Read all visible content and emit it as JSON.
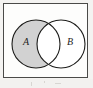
{
  "figure": {
    "kind": "venn-diagram",
    "caption": "",
    "shaded_description": "A minus B",
    "background_color": "#f4f3f1"
  },
  "universe": {
    "label": "",
    "border_color": "#4a4a48",
    "fill_color": "#fdfdfc"
  },
  "sets": [
    {
      "id": "A",
      "label": "A",
      "shaded": true,
      "fill_color": "#d2d2d2",
      "stroke_color": "#1d1d1b",
      "cx": 32,
      "cy": 40,
      "r": 24
    },
    {
      "id": "B",
      "label": "B",
      "shaded": false,
      "fill_color": "#ffffff",
      "stroke_color": "#1d1d1b",
      "cx": 57,
      "cy": 40,
      "r": 24
    }
  ],
  "regions": {
    "a_only": {
      "shaded": true,
      "fill_color": "#d2d2d2"
    },
    "intersection": {
      "shaded": false,
      "fill_color": "#ffffff"
    },
    "b_only": {
      "shaded": false,
      "fill_color": "#ffffff"
    },
    "outside": {
      "shaded": false,
      "fill_color": "#fdfdfc"
    }
  }
}
